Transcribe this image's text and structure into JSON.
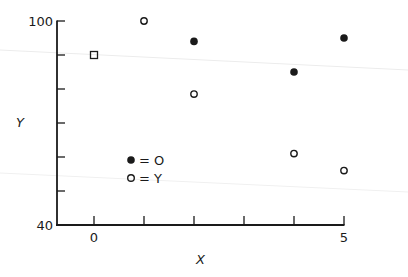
{
  "chart_data": {
    "type": "scatter",
    "title": "",
    "xlabel": "X",
    "ylabel": "Y",
    "xlim": [
      -0.75,
      5
    ],
    "ylim": [
      40,
      100
    ],
    "grid": false,
    "x_ticks": [
      0,
      1,
      2,
      3,
      4,
      5
    ],
    "x_tick_labels": [
      "0",
      "",
      "",
      "",
      "",
      "5"
    ],
    "y_ticks": [
      40,
      50,
      60,
      70,
      80,
      90,
      100
    ],
    "y_tick_labels": [
      "40",
      "",
      "",
      "",
      "",
      "",
      "100"
    ],
    "legend_position": "inside-lower-left",
    "series": [
      {
        "name": "O",
        "marker": "filled-circle",
        "legend_label": "= O",
        "points": [
          {
            "x": 2,
            "y": 94
          },
          {
            "x": 4,
            "y": 85
          },
          {
            "x": 5,
            "y": 95
          }
        ]
      },
      {
        "name": "Y",
        "marker": "open-circle",
        "legend_label": "= Y",
        "points": [
          {
            "x": 1,
            "y": 100
          },
          {
            "x": 2,
            "y": 78.5
          },
          {
            "x": 4,
            "y": 61
          },
          {
            "x": 5,
            "y": 56
          }
        ]
      },
      {
        "name": "reference",
        "marker": "open-square",
        "legend_label": "",
        "points": [
          {
            "x": 0,
            "y": 90
          }
        ]
      }
    ]
  },
  "layout": {
    "x0_px": 94,
    "x_unit_px": 50,
    "y40_px": 225,
    "y_unit_px": 3.4,
    "axis_left_px": 57,
    "axis_right_px": 344,
    "ink_color": "#1a1a1a"
  }
}
